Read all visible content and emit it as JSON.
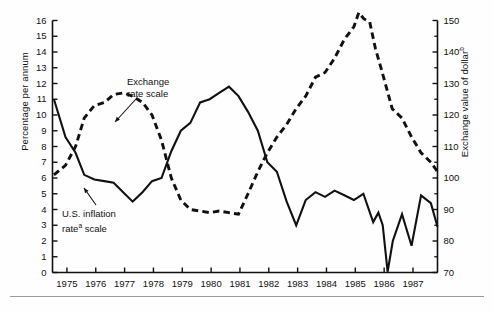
{
  "figure": {
    "background": "#fefefe",
    "line_color": "#111111",
    "frame_color": "#111111"
  },
  "axes": {
    "left": {
      "title": "Percentage per annum",
      "ticks": [
        0,
        1,
        2,
        3,
        4,
        5,
        6,
        7,
        8,
        9,
        10,
        11,
        12,
        13,
        14,
        15,
        16
      ],
      "min": 0,
      "max": 16
    },
    "right": {
      "title": "Exchange value of dollar",
      "title_superscript": "b",
      "ticks": [
        70,
        80,
        90,
        100,
        110,
        120,
        130,
        140,
        150
      ],
      "minor_ticks": [
        75,
        85,
        95,
        105,
        115,
        125,
        135,
        145
      ],
      "min": 70,
      "max": 150
    },
    "x": {
      "tick_labels": [
        "1975",
        "1976",
        "1977",
        "1978",
        "1979",
        "1980",
        "1981",
        "1982",
        "1983",
        "1984",
        "1985",
        "1986",
        "1987"
      ],
      "min": 1974.5,
      "max": 1987.85
    }
  },
  "annotations": [
    {
      "name": "exchange-rate-annotation",
      "line1": "Exchange",
      "line2": "rate scale",
      "x": 127,
      "y": 76
    },
    {
      "name": "us-inflation-annotation",
      "line1": "U.S. inflation",
      "line2_pre": "rate",
      "line2_sup": "a",
      "line2_post": " scale",
      "x": 62,
      "y": 208
    }
  ],
  "chart_data": {
    "type": "line",
    "title": "",
    "xlabel": "",
    "ylabel": "Percentage per annum",
    "y2label": "Exchange value of dollar",
    "grid": false,
    "legend": "annotations-inline",
    "xlim": [
      1974.5,
      1987.85
    ],
    "ylim": [
      0,
      16
    ],
    "y2lim": [
      70,
      150
    ],
    "series": [
      {
        "name": "U.S. inflation rate scale",
        "axis": "left",
        "style": "solid",
        "units": "percent per annum",
        "x": [
          1974.55,
          1974.95,
          1975.3,
          1975.6,
          1975.95,
          1976.3,
          1976.62,
          1976.95,
          1977.28,
          1977.62,
          1977.95,
          1978.28,
          1978.62,
          1978.95,
          1979.28,
          1979.62,
          1979.95,
          1980.28,
          1980.62,
          1980.95,
          1981.28,
          1981.62,
          1981.95,
          1982.28,
          1982.62,
          1982.95,
          1983.28,
          1983.62,
          1983.95,
          1984.28,
          1984.62,
          1984.95,
          1985.28,
          1985.62,
          1985.8,
          1985.95,
          1986.12,
          1986.3,
          1986.62,
          1986.95,
          1987.28,
          1987.62,
          1987.85
        ],
        "y": [
          11.0,
          8.6,
          7.6,
          6.2,
          5.9,
          5.8,
          5.7,
          5.1,
          4.5,
          5.1,
          5.8,
          6.0,
          7.7,
          9.0,
          9.5,
          10.8,
          11.0,
          11.4,
          11.8,
          11.2,
          10.2,
          9.0,
          7.0,
          6.4,
          4.5,
          3.0,
          4.6,
          5.1,
          4.8,
          5.2,
          4.9,
          4.6,
          5.0,
          3.2,
          3.8,
          3.0,
          0.05,
          2.0,
          3.7,
          1.7,
          4.9,
          4.4,
          2.9
        ]
      },
      {
        "name": "Exchange rate scale",
        "axis": "right",
        "style": "dashed",
        "units": "index, March 1973 = 100",
        "x": [
          1974.55,
          1974.95,
          1975.3,
          1975.6,
          1975.95,
          1976.3,
          1976.62,
          1976.95,
          1977.28,
          1977.62,
          1977.95,
          1978.28,
          1978.62,
          1978.95,
          1979.28,
          1979.62,
          1979.95,
          1980.28,
          1980.62,
          1980.95,
          1981.28,
          1981.62,
          1981.95,
          1982.28,
          1982.62,
          1982.95,
          1983.28,
          1983.62,
          1983.95,
          1984.28,
          1984.62,
          1984.95,
          1985.12,
          1985.3,
          1985.5,
          1985.7,
          1985.95,
          1986.28,
          1986.62,
          1986.95,
          1987.28,
          1987.62,
          1987.85
        ],
        "y": [
          101.0,
          104.0,
          110.0,
          119.0,
          123.0,
          124.0,
          126.5,
          127.0,
          126.0,
          124.0,
          120.0,
          112.0,
          100.0,
          93.0,
          90.0,
          89.5,
          89.0,
          89.5,
          89.0,
          88.5,
          95.0,
          102.0,
          108.0,
          113.0,
          117.0,
          122.0,
          126.0,
          132.0,
          133.5,
          138.0,
          144.0,
          148.0,
          152.5,
          150.5,
          149.5,
          141.0,
          133.0,
          122.0,
          119.0,
          113.0,
          108.0,
          105.0,
          102.0
        ]
      }
    ]
  }
}
